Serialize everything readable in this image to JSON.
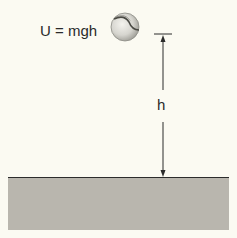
{
  "diagram": {
    "formula_label": "U = mgh",
    "height_label": "h",
    "elements": {
      "ball": {
        "shape": "sphere",
        "description": "ball with seam, elevated above ground"
      },
      "height_dimension": {
        "type": "double-arrow",
        "from": "ground",
        "to": "ball-level tick"
      },
      "ground": {
        "type": "rectangle",
        "description": "gray ground surface"
      }
    },
    "colors": {
      "background": "#fbfaf2",
      "ground_fill": "#b9b6ae",
      "ground_line": "#2b2b2b",
      "ball_fill": "#d9d8d2",
      "ball_seam": "#4a4a44",
      "line": "#2b2b2b"
    }
  }
}
